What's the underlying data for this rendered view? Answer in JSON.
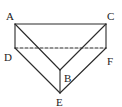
{
  "diagram": {
    "type": "triangular-prism",
    "colors": {
      "stroke": "#2a2a2a",
      "label": "#222222",
      "background": "#ffffff"
    },
    "vertices": {
      "A": {
        "x": 15,
        "y": 24,
        "label": "A",
        "lx": 6,
        "ly": 20
      },
      "C": {
        "x": 106,
        "y": 24,
        "label": "C",
        "lx": 107,
        "ly": 20
      },
      "D": {
        "x": 15,
        "y": 48,
        "label": "D",
        "lx": 4,
        "ly": 61
      },
      "F": {
        "x": 106,
        "y": 48,
        "label": "F",
        "lx": 107,
        "ly": 65
      },
      "B": {
        "x": 60,
        "y": 70,
        "label": "B",
        "lx": 64,
        "ly": 82
      },
      "E": {
        "x": 60,
        "y": 93,
        "label": "E",
        "lx": 56,
        "ly": 106
      }
    },
    "solid_edges": [
      [
        "A",
        "C"
      ],
      [
        "A",
        "B"
      ],
      [
        "C",
        "B"
      ],
      [
        "A",
        "D"
      ],
      [
        "C",
        "F"
      ],
      [
        "B",
        "E"
      ],
      [
        "D",
        "E"
      ],
      [
        "F",
        "E"
      ]
    ],
    "dashed_edges": [
      [
        "D",
        "F"
      ]
    ]
  }
}
